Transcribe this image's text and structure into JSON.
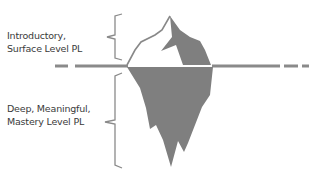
{
  "diagram": {
    "type": "iceberg",
    "colors": {
      "iceberg_fill": "#7f7f7f",
      "outline": "#888888",
      "waterline": "#8a8a8a",
      "text": "#3a3a3a"
    },
    "above_water": {
      "label_line1": "Introductory,",
      "label_line2": "Surface Level PL"
    },
    "below_water": {
      "label_line1": "Deep, Meaningful,",
      "label_line2": "Mastery Level PL"
    }
  }
}
